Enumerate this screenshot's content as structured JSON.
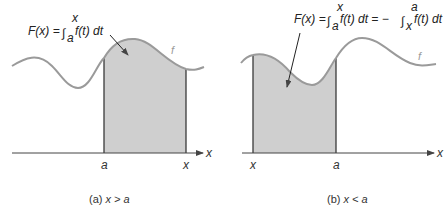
{
  "colors": {
    "curve": "#9a9a9a",
    "fill": "#cfcfcf",
    "edge": "#3a3a3a",
    "axis": "#444444",
    "text": "#333333"
  },
  "panel_a": {
    "formula": {
      "lhs": "F(x) = ",
      "integral": "∫",
      "lower": "a",
      "upper": "x",
      "integrand": "f(t) dt"
    },
    "curve_label": "f",
    "axis_label": "x",
    "tick_labels": [
      "a",
      "x"
    ],
    "caption": {
      "prefix": "(a) ",
      "condition": "x > a"
    }
  },
  "panel_b": {
    "formula": {
      "lhs": "F(x) = ",
      "integral1": "∫",
      "lower1": "a",
      "upper1": "x",
      "integrand1": "f(t) dt = − ",
      "integral2": "∫",
      "lower2": "x",
      "upper2": "a",
      "integrand2": "f(t) dt"
    },
    "curve_label": "f",
    "axis_label": "x",
    "tick_labels": [
      "x",
      "a"
    ],
    "caption": {
      "prefix": "(b) ",
      "condition": "x < a"
    }
  }
}
